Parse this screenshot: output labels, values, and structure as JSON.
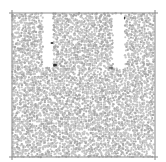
{
  "figure": {
    "width": 166,
    "height": 162,
    "background": "#ffffff",
    "box": {
      "x0": 12,
      "y0": 13,
      "x1": 155,
      "y1": 157,
      "stroke": "#8a8a8a",
      "stroke_width": 1,
      "tick_overhang": 3
    },
    "particles": {
      "color": "#c4c4c4",
      "edge_color": "#a9a9a9",
      "radius": 1.15,
      "spacing": 2.15,
      "jitter": 0.9,
      "seed": 7
    },
    "voids": [
      {
        "name": "left-channel",
        "x0": 43,
        "y0": 14,
        "x1": 53,
        "y1": 67
      },
      {
        "name": "right-channel",
        "x0": 113,
        "y0": 14,
        "x1": 125,
        "y1": 68
      }
    ],
    "markers": [
      {
        "name": "marker-1",
        "x": 52,
        "y": 43,
        "w": 3,
        "h": 2,
        "color": "#3a3a3a"
      },
      {
        "name": "marker-2",
        "x": 55,
        "y": 65,
        "w": 4,
        "h": 3,
        "color": "#2e2e2e"
      },
      {
        "name": "marker-3",
        "x": 124.5,
        "y": 18,
        "w": 1.2,
        "h": 3,
        "color": "#3a3a3a"
      },
      {
        "name": "marker-4",
        "x": 111,
        "y": 68,
        "w": 5,
        "h": 1.5,
        "color": "#505050"
      }
    ]
  }
}
